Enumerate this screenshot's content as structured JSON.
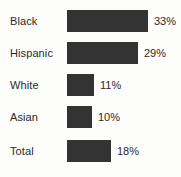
{
  "chart_data": {
    "type": "bar",
    "orientation": "horizontal",
    "title": "",
    "subtitle": "",
    "xlabel": "",
    "ylabel": "",
    "categories": [
      "Black",
      "Hispanic",
      "White",
      "Asian",
      "Total"
    ],
    "values": [
      33,
      29,
      11,
      10,
      18
    ],
    "value_labels": [
      "33%",
      "29%",
      "11%",
      "10%",
      "18%"
    ],
    "units": "percent",
    "xlim": [
      0,
      33
    ],
    "grid": false,
    "legend": null,
    "bar_color": "#333333",
    "text_color": "#2a2a2a",
    "background_color": "#fdfdfb"
  }
}
